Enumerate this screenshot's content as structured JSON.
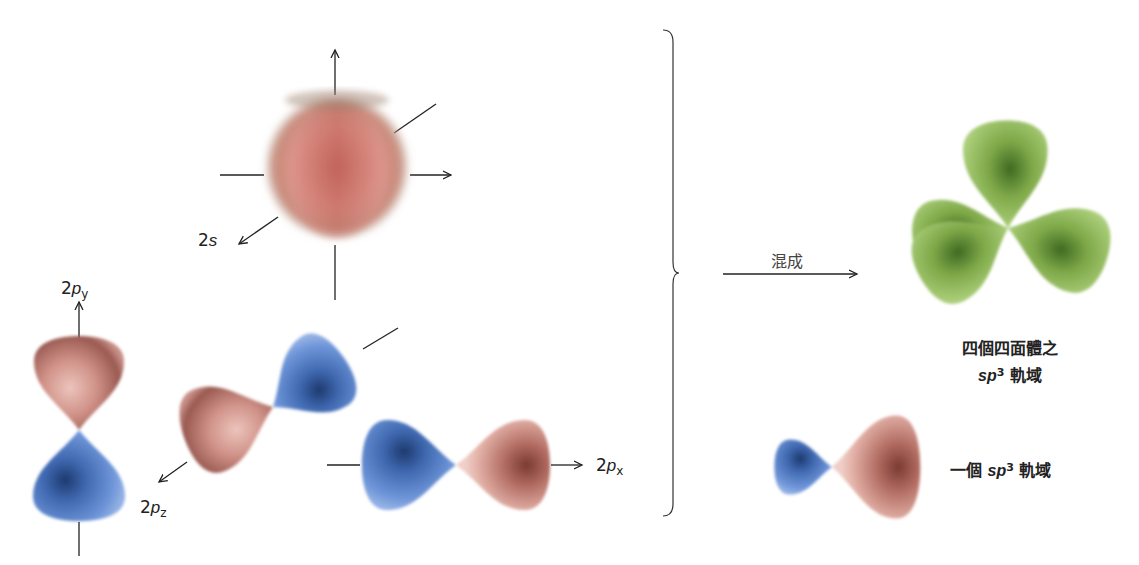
{
  "diagram": {
    "type": "orbital-hybridization",
    "colors": {
      "positive_lobe": "#c98a80",
      "negative_lobe": "#5b82c9",
      "hybrid_lobe": "#8fb85a",
      "axis": "#222222"
    },
    "atomic_orbitals": [
      {
        "id": "2s",
        "label_main": "2",
        "label_italic": "s",
        "label_sub": ""
      },
      {
        "id": "2py",
        "label_main": "2",
        "label_italic": "p",
        "label_sub": "y"
      },
      {
        "id": "2pz",
        "label_main": "2",
        "label_italic": "p",
        "label_sub": "z"
      },
      {
        "id": "2px",
        "label_main": "2",
        "label_italic": "p",
        "label_sub": "x"
      }
    ],
    "process": {
      "arrow_label": "混成"
    },
    "result": {
      "tetrahedral": {
        "line1": "四個四面體之",
        "sp": "sp",
        "sup": "3",
        "suffix": " 軌域"
      },
      "single": {
        "prefix": "一個 ",
        "sp": "sp",
        "sup": "3",
        "suffix": " 軌域"
      }
    }
  }
}
